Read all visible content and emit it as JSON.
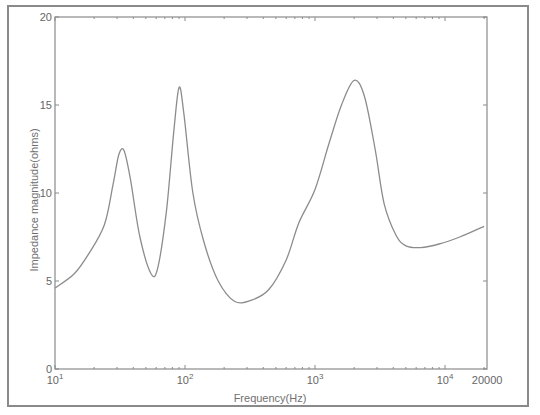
{
  "chart_data": {
    "type": "line",
    "title": "",
    "xlabel": "Frequency(Hz)",
    "ylabel": "Impedance magnitude(ohms)",
    "xscale": "log",
    "xlim": [
      10,
      20000
    ],
    "ylim": [
      0,
      20
    ],
    "grid": false,
    "legend": null,
    "x_ticks": [
      {
        "value": 10,
        "base": "10",
        "exp": "1"
      },
      {
        "value": 100,
        "base": "10",
        "exp": "2"
      },
      {
        "value": 1000,
        "base": "10",
        "exp": "3"
      },
      {
        "value": 10000,
        "base": "10",
        "exp": "4"
      },
      {
        "value": 20000,
        "label": "20000"
      }
    ],
    "y_ticks": [
      0,
      5,
      10,
      15,
      20
    ],
    "series": [
      {
        "name": "impedance",
        "color": "#8c8c8c",
        "x": [
          10,
          14,
          18,
          24,
          28,
          31,
          34,
          38,
          45,
          55,
          62,
          72,
          82,
          90,
          98,
          115,
          140,
          180,
          240,
          320,
          440,
          600,
          750,
          1000,
          1280,
          1600,
          2000,
          2400,
          2900,
          3400,
          4200,
          5000,
          6500,
          9000,
          13000,
          20000
        ],
        "values": [
          4.6,
          5.4,
          6.5,
          8.2,
          10.5,
          12.2,
          12.4,
          10.8,
          7.5,
          5.4,
          5.8,
          9.0,
          13.5,
          16.0,
          14.5,
          10.0,
          7.2,
          5.0,
          3.85,
          3.9,
          4.5,
          6.2,
          8.3,
          10.2,
          12.8,
          15.0,
          16.4,
          15.5,
          12.5,
          9.4,
          7.6,
          7.0,
          6.9,
          7.1,
          7.5,
          8.1
        ]
      }
    ]
  }
}
